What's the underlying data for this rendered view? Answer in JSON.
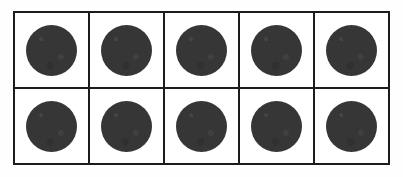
{
  "figure": {
    "kind": "ten-frame",
    "rows": 2,
    "columns": 5,
    "total_cells": 10,
    "filled_count": 10,
    "empty_count": 0,
    "colors": {
      "page_background": "#fefefe",
      "cell_background": "#ffffff",
      "grid_line": "#1c1c1c",
      "counter_fill": "#363636"
    },
    "geometry": {
      "frame_left_px": 13,
      "frame_top_px": 11,
      "frame_width_px": 377,
      "frame_height_px": 154,
      "cell_width_px": 75,
      "cell_height_px": 75,
      "border_width_px": 2,
      "counter_diameter_px": 51
    }
  },
  "grid": {
    "rows": [
      {
        "row_name": "top-row",
        "cells": [
          {
            "cell_name": "cell-r1c1",
            "filled": true,
            "counter_label": ""
          },
          {
            "cell_name": "cell-r1c2",
            "filled": true,
            "counter_label": ""
          },
          {
            "cell_name": "cell-r1c3",
            "filled": true,
            "counter_label": ""
          },
          {
            "cell_name": "cell-r1c4",
            "filled": true,
            "counter_label": ""
          },
          {
            "cell_name": "cell-r1c5",
            "filled": true,
            "counter_label": ""
          }
        ]
      },
      {
        "row_name": "bottom-row",
        "cells": [
          {
            "cell_name": "cell-r2c1",
            "filled": true,
            "counter_label": ""
          },
          {
            "cell_name": "cell-r2c2",
            "filled": true,
            "counter_label": ""
          },
          {
            "cell_name": "cell-r2c3",
            "filled": true,
            "counter_label": ""
          },
          {
            "cell_name": "cell-r2c4",
            "filled": true,
            "counter_label": ""
          },
          {
            "cell_name": "cell-r2c5",
            "filled": true,
            "counter_label": ""
          }
        ]
      }
    ]
  }
}
